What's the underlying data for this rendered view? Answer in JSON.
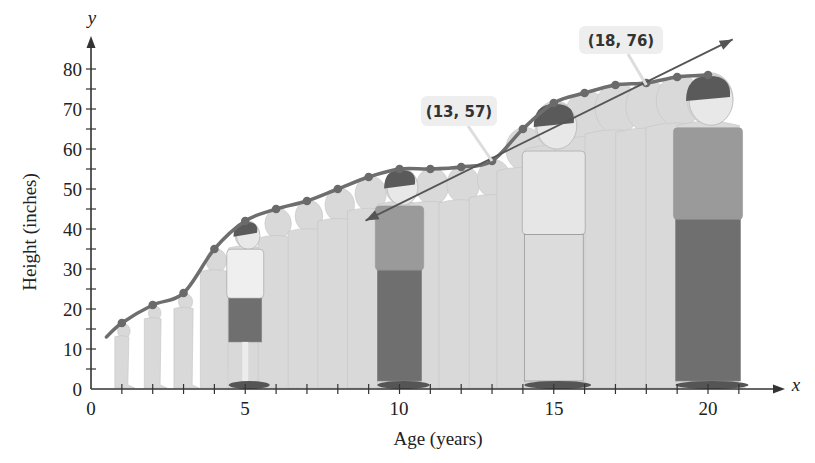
{
  "chart_data": {
    "type": "line",
    "title": "",
    "xlabel": "Age (years)",
    "ylabel": "Height (inches)",
    "x_axis_var": "x",
    "y_axis_var": "y",
    "xlim": [
      0,
      21
    ],
    "ylim": [
      0,
      85
    ],
    "x_ticks": [
      0,
      5,
      10,
      15,
      20
    ],
    "x_minor_ticks": [
      1,
      2,
      3,
      4,
      6,
      7,
      8,
      9,
      11,
      12,
      13,
      14,
      16,
      17,
      18,
      19,
      21
    ],
    "y_ticks": [
      0,
      10,
      20,
      30,
      40,
      50,
      60,
      70,
      80
    ],
    "y_minor_ticks": [
      5,
      15,
      25,
      35,
      45,
      55,
      65,
      75
    ],
    "origin_label": "0",
    "grid": false,
    "legend": null,
    "series": [
      {
        "name": "Height by age",
        "style": "smooth curve with dots",
        "color": "#6e6e6e",
        "x": [
          0.5,
          1,
          2,
          3,
          4,
          5,
          6,
          7,
          8,
          9,
          10,
          11,
          12,
          13,
          14,
          15,
          16,
          17,
          18,
          19,
          20
        ],
        "y": [
          13,
          16.5,
          21,
          24,
          35,
          42,
          45,
          47,
          50,
          53,
          55,
          55,
          55.5,
          57,
          65,
          71.5,
          74,
          76,
          76.5,
          78,
          78.5
        ],
        "markers_at": [
          1,
          2,
          3,
          4,
          5,
          6,
          7,
          8,
          9,
          10,
          11,
          12,
          13,
          14,
          15,
          16,
          17,
          18,
          19,
          20
        ]
      },
      {
        "name": "Line through (13, 57) and (18, 76)",
        "style": "double-headed arrow line",
        "color": "#555555",
        "x": [
          8.9,
          20.8
        ],
        "y": [
          42.1,
          87.4
        ],
        "slope": 3.8
      }
    ],
    "annotations": [
      {
        "text": "(13, 57)",
        "point": [
          13,
          57
        ]
      },
      {
        "text": "(18, 76)",
        "point": [
          18,
          76
        ]
      }
    ],
    "background_illustration": "silhouettes of a person growing from age 1 to 20; highlighted figures at ages 5, 10, 15, 20"
  },
  "labels": {
    "xlabel": "Age (years)",
    "ylabel": "Height (inches)",
    "x_var": "x",
    "y_var": "y",
    "origin": "0",
    "callout_1": "(13, 57)",
    "callout_2": "(18, 76)",
    "x_ticks": [
      "5",
      "10",
      "15",
      "20"
    ],
    "y_ticks": [
      "0",
      "10",
      "20",
      "30",
      "40",
      "50",
      "60",
      "70",
      "80"
    ]
  },
  "colors": {
    "axis": "#333333",
    "curve": "#6e6e6e",
    "dots": "#6a6a6a",
    "regression_line": "#555555",
    "silhouette": "#d9d9d9",
    "silhouette_edge": "#c4c4c4",
    "callout_bg": "#eeeeee",
    "highlight_shirt": "#9a9a9a",
    "highlight_pants": "#6f6f6f",
    "hair": "#5a5a5a",
    "skin": "#e8e8e8"
  }
}
